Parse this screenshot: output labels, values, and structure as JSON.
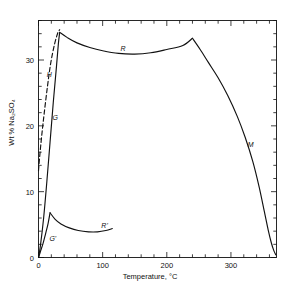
{
  "chart_data": {
    "type": "line",
    "title": "",
    "xlabel": "Temperature, °C",
    "ylabel": "Wt % Na2SO4",
    "ylabel_display": "Wt % Na₂SO₄",
    "xlim": [
      0,
      371
    ],
    "ylim": [
      0,
      36
    ],
    "grid": false,
    "legend": "none",
    "x_ticks_major": [
      0,
      100,
      200,
      300
    ],
    "x_ticks_major_labels": [
      "0",
      "100",
      "200",
      "300"
    ],
    "x_tick_minor_step": 20,
    "y_ticks_major": [
      0,
      10,
      20,
      30
    ],
    "y_ticks_major_labels": [
      "0",
      "10",
      "20",
      "30"
    ],
    "y_tick_minor_step": 2,
    "annotations": [
      {
        "text": "H",
        "x": 13,
        "y": 27.5,
        "note": "metastable dashed branch label"
      },
      {
        "text": "G",
        "x": 22,
        "y": 21.0,
        "note": "stable decahydrate branch label"
      },
      {
        "text": "R",
        "x": 128,
        "y": 31.5,
        "note": "anhydrous solubility plateau label"
      },
      {
        "text": "M",
        "x": 326,
        "y": 17.0,
        "note": "descending anhydrous branch label"
      },
      {
        "text": "G'",
        "x": 17,
        "y": 2.6,
        "note": "lower branch label"
      },
      {
        "text": "R'",
        "x": 98,
        "y": 4.7,
        "note": "lower plateau label"
      }
    ],
    "series": [
      {
        "name": "G",
        "style": "solid",
        "label": "G",
        "points": [
          [
            0,
            0.0
          ],
          [
            3,
            1.8
          ],
          [
            8,
            6.0
          ],
          [
            13,
            11.5
          ],
          [
            18,
            17.5
          ],
          [
            23,
            23.5
          ],
          [
            28,
            29.0
          ],
          [
            31,
            32.5
          ],
          [
            33,
            34.2
          ]
        ]
      },
      {
        "name": "H",
        "style": "dashed",
        "label": "H",
        "points": [
          [
            0,
            13.2
          ],
          [
            2,
            15.5
          ],
          [
            5,
            18.5
          ],
          [
            9,
            22.0
          ],
          [
            14,
            26.0
          ],
          [
            19,
            29.5
          ],
          [
            25,
            32.4
          ],
          [
            30,
            34.1
          ],
          [
            33,
            34.6
          ]
        ]
      },
      {
        "name": "R",
        "style": "solid",
        "label": "R",
        "points": [
          [
            33,
            34.2
          ],
          [
            45,
            33.4
          ],
          [
            60,
            32.6
          ],
          [
            80,
            31.9
          ],
          [
            100,
            31.4
          ],
          [
            125,
            31.0
          ],
          [
            150,
            30.9
          ],
          [
            175,
            31.1
          ],
          [
            200,
            31.6
          ],
          [
            225,
            32.2
          ],
          [
            240,
            33.3
          ]
        ]
      },
      {
        "name": "M",
        "style": "solid",
        "label": "M",
        "points": [
          [
            240,
            33.3
          ],
          [
            252,
            31.6
          ],
          [
            265,
            29.6
          ],
          [
            280,
            27.3
          ],
          [
            295,
            24.6
          ],
          [
            310,
            21.4
          ],
          [
            322,
            18.3
          ],
          [
            334,
            14.6
          ],
          [
            344,
            10.7
          ],
          [
            352,
            7.0
          ],
          [
            358,
            4.2
          ],
          [
            363,
            2.2
          ],
          [
            367,
            1.0
          ],
          [
            370,
            0.4
          ]
        ]
      },
      {
        "name": "G-prime",
        "style": "solid",
        "label": "G'",
        "points": [
          [
            0,
            0.0
          ],
          [
            3,
            0.9
          ],
          [
            7,
            2.1
          ],
          [
            11,
            3.6
          ],
          [
            15,
            5.2
          ],
          [
            18,
            6.8
          ]
        ]
      },
      {
        "name": "R-prime",
        "style": "solid",
        "label": "R'",
        "points": [
          [
            18,
            6.8
          ],
          [
            26,
            5.8
          ],
          [
            35,
            5.1
          ],
          [
            48,
            4.5
          ],
          [
            62,
            4.1
          ],
          [
            78,
            3.9
          ],
          [
            92,
            3.9
          ],
          [
            105,
            4.1
          ],
          [
            115,
            4.4
          ]
        ]
      }
    ]
  }
}
